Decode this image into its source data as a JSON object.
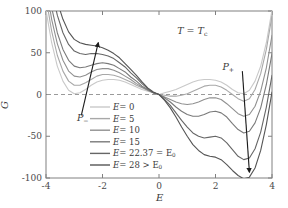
{
  "chart_data": {
    "type": "line",
    "title": "",
    "xlabel": "E",
    "ylabel": "G",
    "xlim": [
      -4,
      4
    ],
    "ylim": [
      -100,
      100
    ],
    "xticks": [
      -4,
      -2,
      0,
      2,
      4
    ],
    "yticks": [
      -100,
      -50,
      0,
      50,
      100
    ],
    "xticklabels": [
      "-4",
      "-2",
      "0",
      "2",
      "4"
    ],
    "yticklabels": [
      "-100",
      "-50",
      "0",
      "50",
      "100"
    ],
    "grid": false,
    "legend_position": "center-left",
    "zero_line": {
      "value": 0,
      "style": "dashed"
    },
    "annotations": [
      {
        "name": "temperature-condition",
        "text": "T = T",
        "sub": "c",
        "x": 1.0,
        "y": 76
      },
      {
        "name": "p-minus-label",
        "text": "P",
        "sub": "−",
        "x": -2.55,
        "y": -28
      },
      {
        "name": "p-plus-label",
        "text": "P",
        "sub": "+",
        "x": 2.6,
        "y": 33
      }
    ],
    "arrows": [
      {
        "name": "p-minus-arrow",
        "from": [
          -2.75,
          -25
        ],
        "to": [
          -2.15,
          62
        ],
        "direction": "up"
      },
      {
        "name": "p-plus-arrow",
        "from": [
          2.95,
          28
        ],
        "to": [
          3.2,
          -93
        ],
        "direction": "down"
      }
    ],
    "series": [
      {
        "name": "E=0",
        "label": "E = 0",
        "value": 0,
        "color": "#c9c9c9",
        "x": [
          -4.0,
          -3.8,
          -3.6,
          -3.4,
          -3.2,
          -3.0,
          -2.8,
          -2.6,
          -2.4,
          -2.2,
          -2.0,
          -1.8,
          -1.6,
          -1.4,
          -1.2,
          -1.0,
          -0.8,
          -0.6,
          -0.4,
          -0.2,
          0.0,
          0.2,
          0.4,
          0.6,
          0.8,
          1.0,
          1.2,
          1.4,
          1.6,
          1.8,
          2.0,
          2.2,
          2.4,
          2.6,
          2.8,
          3.0,
          3.2,
          3.4,
          3.6,
          3.8,
          4.0
        ],
        "y": [
          101,
          62,
          34,
          16,
          5,
          1,
          2,
          6,
          11,
          15,
          17,
          18,
          18,
          17,
          15,
          12,
          9,
          6,
          4,
          2,
          0,
          2,
          4,
          6,
          9,
          12,
          15,
          17,
          18,
          18,
          17,
          15,
          11,
          6,
          2,
          1,
          5,
          16,
          34,
          62,
          101
        ]
      },
      {
        "name": "E=5",
        "label": "E = 5",
        "value": 5,
        "color": "#a8a8a8",
        "x": [
          -4.0,
          -3.8,
          -3.6,
          -3.4,
          -3.2,
          -3.0,
          -2.8,
          -2.6,
          -2.4,
          -2.2,
          -2.0,
          -1.8,
          -1.6,
          -1.4,
          -1.2,
          -1.0,
          -0.8,
          -0.6,
          -0.4,
          -0.2,
          0.0,
          0.2,
          0.4,
          0.6,
          0.8,
          1.0,
          1.2,
          1.4,
          1.6,
          1.8,
          2.0,
          2.2,
          2.4,
          2.6,
          2.8,
          3.0,
          3.2,
          3.4,
          3.6,
          3.8,
          4.0
        ],
        "y": [
          116,
          76,
          47,
          28,
          16,
          11,
          11,
          14,
          18,
          22,
          24,
          24,
          23,
          21,
          18,
          15,
          11,
          8,
          5,
          2,
          0,
          -1,
          -2,
          -2,
          -1,
          1,
          4,
          7,
          10,
          11,
          11,
          9,
          5,
          0,
          -5,
          -8,
          -5,
          6,
          25,
          54,
          94
        ]
      },
      {
        "name": "E=10",
        "label": "E = 10",
        "value": 10,
        "color": "#909090",
        "x": [
          -4.0,
          -3.8,
          -3.6,
          -3.4,
          -3.2,
          -3.0,
          -2.8,
          -2.6,
          -2.4,
          -2.2,
          -2.0,
          -1.8,
          -1.6,
          -1.4,
          -1.2,
          -1.0,
          -0.8,
          -0.6,
          -0.4,
          -0.2,
          0.0,
          0.2,
          0.4,
          0.6,
          0.8,
          1.0,
          1.2,
          1.4,
          1.6,
          1.8,
          2.0,
          2.2,
          2.4,
          2.6,
          2.8,
          3.0,
          3.2,
          3.4,
          3.6,
          3.8,
          4.0
        ],
        "y": [
          131,
          90,
          61,
          41,
          28,
          22,
          21,
          23,
          27,
          30,
          31,
          31,
          29,
          26,
          22,
          18,
          13,
          9,
          5,
          2,
          0,
          -3,
          -6,
          -9,
          -11,
          -12,
          -11,
          -9,
          -6,
          -4,
          -4,
          -6,
          -11,
          -17,
          -23,
          -26,
          -24,
          -14,
          4,
          32,
          71
        ]
      },
      {
        "name": "E=15",
        "label": "E = 15",
        "value": 15,
        "color": "#7a7a7a",
        "x": [
          -4.0,
          -3.8,
          -3.6,
          -3.4,
          -3.2,
          -3.0,
          -2.8,
          -2.6,
          -2.4,
          -2.2,
          -2.0,
          -1.8,
          -1.6,
          -1.4,
          -1.2,
          -1.0,
          -0.8,
          -0.6,
          -0.4,
          -0.2,
          0.0,
          0.2,
          0.4,
          0.6,
          0.8,
          1.0,
          1.2,
          1.4,
          1.6,
          1.8,
          2.0,
          2.2,
          2.4,
          2.6,
          2.8,
          3.0,
          3.2,
          3.4,
          3.6,
          3.8,
          4.0
        ],
        "y": [
          146,
          104,
          74,
          54,
          41,
          34,
          32,
          33,
          35,
          37,
          38,
          37,
          35,
          31,
          27,
          21,
          16,
          10,
          6,
          2,
          0,
          -4,
          -9,
          -15,
          -20,
          -24,
          -26,
          -26,
          -24,
          -21,
          -20,
          -22,
          -27,
          -35,
          -42,
          -46,
          -44,
          -34,
          -16,
          12,
          49
        ]
      },
      {
        "name": "E=22.37",
        "label": "E = 22.37 = E₀",
        "value": 22.37,
        "color": "#666666",
        "x": [
          -4.0,
          -3.8,
          -3.6,
          -3.4,
          -3.2,
          -3.0,
          -2.8,
          -2.6,
          -2.4,
          -2.2,
          -2.0,
          -1.8,
          -1.6,
          -1.4,
          -1.2,
          -1.0,
          -0.8,
          -0.6,
          -0.4,
          -0.2,
          0.0,
          0.2,
          0.4,
          0.6,
          0.8,
          1.0,
          1.2,
          1.4,
          1.6,
          1.8,
          2.0,
          2.2,
          2.4,
          2.6,
          2.8,
          3.0,
          3.2,
          3.4,
          3.6,
          3.8,
          4.0
        ],
        "y": [
          168,
          126,
          95,
          74,
          60,
          52,
          49,
          48,
          49,
          49,
          48,
          46,
          43,
          38,
          33,
          26,
          20,
          13,
          7,
          2,
          0,
          -6,
          -13,
          -22,
          -31,
          -39,
          -46,
          -50,
          -52,
          -51,
          -50,
          -52,
          -58,
          -66,
          -74,
          -78,
          -76,
          -65,
          -45,
          -15,
          23
        ]
      },
      {
        "name": "E=28",
        "label": "E = 28 > E₀",
        "value": 28,
        "color": "#555555",
        "x": [
          -4.0,
          -3.8,
          -3.6,
          -3.4,
          -3.2,
          -3.0,
          -2.8,
          -2.6,
          -2.4,
          -2.2,
          -2.0,
          -1.8,
          -1.6,
          -1.4,
          -1.2,
          -1.0,
          -0.8,
          -0.6,
          -0.4,
          -0.2,
          0.0,
          0.2,
          0.4,
          0.6,
          0.8,
          1.0,
          1.2,
          1.4,
          1.6,
          1.8,
          2.0,
          2.2,
          2.4,
          2.6,
          2.8,
          3.0,
          3.2,
          3.4,
          3.6,
          3.8,
          4.0
        ],
        "y": [
          185,
          142,
          111,
          90,
          75,
          66,
          62,
          60,
          59,
          58,
          56,
          53,
          49,
          44,
          37,
          30,
          23,
          15,
          8,
          3,
          0,
          -7,
          -16,
          -27,
          -39,
          -50,
          -60,
          -67,
          -72,
          -74,
          -75,
          -78,
          -84,
          -91,
          -97,
          -101,
          -99,
          -88,
          -67,
          -36,
          3
        ]
      }
    ]
  },
  "axes": {
    "y_label": "G",
    "x_label": "E"
  },
  "legend": {
    "items": [
      {
        "label_prefix": "E",
        "eq": "= 0",
        "full": "E = 0"
      },
      {
        "label_prefix": "E",
        "eq": "= 5",
        "full": "E = 5"
      },
      {
        "label_prefix": "E",
        "eq": "= 10",
        "full": "E = 10"
      },
      {
        "label_prefix": "E",
        "eq": "= 15",
        "full": "E = 15"
      },
      {
        "label_prefix": "E",
        "eq": "= 22.37 = E₀",
        "full": "E = 22.37 = E0"
      },
      {
        "label_prefix": "E",
        "eq": "= 28 > E₀",
        "full": "E = 28 > E0"
      }
    ]
  },
  "colors": {
    "frame": "#808080",
    "zero_dash": "#9a9a9a",
    "arrow": "#1a1a1a",
    "text": "#3a3a3a"
  }
}
